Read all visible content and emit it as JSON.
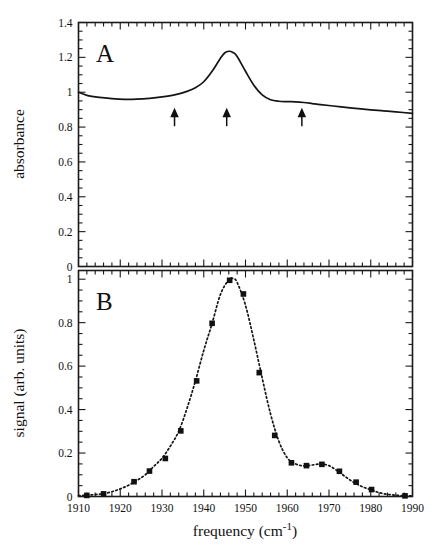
{
  "figure": {
    "xlabel": "frequency (cm",
    "xlabel_sup": "-1",
    "xlabel_tail": ")",
    "panel_a_label": "A",
    "panel_b_label": "B",
    "ylabel_a": "absorbance",
    "ylabel_b": "signal (arb. units)",
    "caption_fragment": ""
  },
  "chart_data": [
    {
      "type": "line",
      "panel": "A",
      "title": "",
      "xlabel": "frequency (cm-1)",
      "ylabel": "absorbance",
      "xlim": [
        1910,
        1990
      ],
      "ylim": [
        0,
        1.4
      ],
      "xticks": [
        1910,
        1920,
        1930,
        1940,
        1950,
        1960,
        1970,
        1980,
        1990
      ],
      "xtick_labels": [
        "1910",
        "1920",
        "1930",
        "1940",
        "1950",
        "1960",
        "1970",
        "1980",
        "1990"
      ],
      "yticks": [
        0,
        0.2,
        0.4,
        0.6,
        0.8,
        1,
        1.2,
        1.4
      ],
      "ytick_labels": [
        "0",
        "0.2",
        "0.4",
        "0.6",
        "0.8",
        "1",
        "1.2",
        "1.4"
      ],
      "minor_ticks_per_interval": 5,
      "grid": false,
      "legend": "none",
      "linestyle": "solid",
      "x": [
        1910,
        1912,
        1915,
        1918,
        1921,
        1924,
        1927,
        1930,
        1933,
        1936,
        1938,
        1940,
        1942,
        1944,
        1945,
        1946,
        1947,
        1948,
        1950,
        1952,
        1954,
        1956,
        1958,
        1960,
        1962,
        1964,
        1966,
        1968,
        1971,
        1974,
        1977,
        1980,
        1983,
        1986,
        1990
      ],
      "y": [
        1.0,
        0.982,
        0.97,
        0.963,
        0.959,
        0.96,
        0.965,
        0.973,
        0.985,
        1.005,
        1.025,
        1.06,
        1.12,
        1.195,
        1.225,
        1.235,
        1.228,
        1.205,
        1.12,
        1.04,
        0.985,
        0.957,
        0.948,
        0.946,
        0.945,
        0.941,
        0.935,
        0.929,
        0.921,
        0.913,
        0.906,
        0.899,
        0.893,
        0.887,
        0.879
      ],
      "annotations": [
        {
          "type": "arrow",
          "direction": "up",
          "x": 1933,
          "y": 0.86,
          "label": ""
        },
        {
          "type": "arrow",
          "direction": "up",
          "x": 1945.5,
          "y": 0.86,
          "label": ""
        },
        {
          "type": "arrow",
          "direction": "up",
          "x": 1963.5,
          "y": 0.86,
          "label": ""
        }
      ]
    },
    {
      "type": "scatter",
      "panel": "B",
      "title": "",
      "xlabel": "frequency (cm-1)",
      "ylabel": "signal (arb. units)",
      "xlim": [
        1910,
        1990
      ],
      "ylim": [
        0,
        1.04
      ],
      "xticks": [
        1910,
        1920,
        1930,
        1940,
        1950,
        1960,
        1970,
        1980,
        1990
      ],
      "xtick_labels": [
        "1910",
        "1920",
        "1930",
        "1940",
        "1950",
        "1960",
        "1970",
        "1980",
        "1990"
      ],
      "yticks": [
        0,
        0.2,
        0.4,
        0.6,
        0.8,
        1
      ],
      "ytick_labels": [
        "0",
        "0.2",
        "0.4",
        "0.6",
        "0.8",
        "1"
      ],
      "minor_ticks_per_interval": 5,
      "grid": false,
      "legend": "none",
      "marker": "filled-square",
      "fit_linestyle": "dotted",
      "points": [
        {
          "x": 1912.0,
          "y": 0.005
        },
        {
          "x": 1916.0,
          "y": 0.012
        },
        {
          "x": 1923.3,
          "y": 0.068
        },
        {
          "x": 1927.0,
          "y": 0.117
        },
        {
          "x": 1930.8,
          "y": 0.175
        },
        {
          "x": 1934.5,
          "y": 0.302
        },
        {
          "x": 1938.3,
          "y": 0.532
        },
        {
          "x": 1942.0,
          "y": 0.797
        },
        {
          "x": 1946.2,
          "y": 0.995
        },
        {
          "x": 1949.5,
          "y": 0.932
        },
        {
          "x": 1953.3,
          "y": 0.57
        },
        {
          "x": 1957.0,
          "y": 0.281
        },
        {
          "x": 1961.0,
          "y": 0.155
        },
        {
          "x": 1964.6,
          "y": 0.142
        },
        {
          "x": 1968.3,
          "y": 0.148
        },
        {
          "x": 1972.5,
          "y": 0.116
        },
        {
          "x": 1976.5,
          "y": 0.066
        },
        {
          "x": 1980.2,
          "y": 0.032
        },
        {
          "x": 1988.2,
          "y": 0.003
        }
      ],
      "fit_curve": {
        "x": [
          1910,
          1912,
          1914,
          1916,
          1918,
          1920,
          1922,
          1924,
          1926,
          1928,
          1930,
          1932,
          1934,
          1936,
          1938,
          1940,
          1942,
          1944,
          1946,
          1947,
          1948,
          1950,
          1952,
          1954,
          1956,
          1958,
          1960,
          1962,
          1964,
          1966,
          1968,
          1970,
          1972,
          1974,
          1976,
          1978,
          1980,
          1982,
          1984,
          1986,
          1988,
          1990
        ],
        "y": [
          0.004,
          0.006,
          0.009,
          0.013,
          0.022,
          0.035,
          0.052,
          0.074,
          0.1,
          0.138,
          0.176,
          0.232,
          0.3,
          0.406,
          0.532,
          0.672,
          0.797,
          0.93,
          0.998,
          1.003,
          0.985,
          0.88,
          0.72,
          0.545,
          0.38,
          0.254,
          0.178,
          0.15,
          0.141,
          0.145,
          0.15,
          0.142,
          0.118,
          0.09,
          0.064,
          0.045,
          0.031,
          0.018,
          0.01,
          0.006,
          0.004,
          0.003
        ]
      }
    }
  ]
}
